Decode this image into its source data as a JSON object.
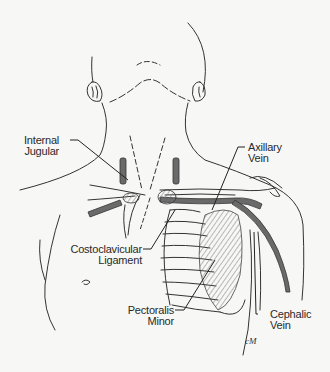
{
  "diagram": {
    "type": "anatomical-illustration",
    "colors": {
      "background": "#f7f7f5",
      "line": "#333333",
      "vein_fill": "#6a6a6a",
      "muscle_hatch": "#8a8a8a"
    },
    "labels": {
      "internal_jugular": {
        "line1": "Internal",
        "line2": "Jugular"
      },
      "axillary_vein": {
        "line1": "Axillary",
        "line2": "Vein"
      },
      "costoclavicular_ligament": {
        "line1": "Costoclavicular",
        "line2": "Ligament"
      },
      "pectoralis_minor": {
        "line1": "Pectoralis",
        "line2": "Minor"
      },
      "cephalic_vein": {
        "line1": "Cephalic",
        "line2": "Vein"
      }
    },
    "signature": "cM"
  }
}
